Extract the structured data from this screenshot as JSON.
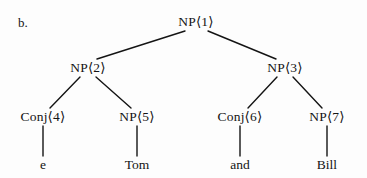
{
  "figure": {
    "label": "b.",
    "caption_present": false
  },
  "diagram": {
    "type": "syntax-tree",
    "background_color": "#fdfdfd",
    "ink_color": "#141414",
    "nodes": [
      {
        "id": "n1",
        "label": "NP⟨1⟩",
        "x": 196,
        "y": 22,
        "kind": "nonterminal"
      },
      {
        "id": "n2",
        "label": "NP⟨2⟩",
        "x": 88,
        "y": 68,
        "kind": "nonterminal"
      },
      {
        "id": "n3",
        "label": "NP⟨3⟩",
        "x": 285,
        "y": 68,
        "kind": "nonterminal"
      },
      {
        "id": "n4",
        "label": "Conj⟨4⟩",
        "x": 43,
        "y": 117,
        "kind": "nonterminal"
      },
      {
        "id": "n5",
        "label": "NP⟨5⟩",
        "x": 137,
        "y": 117,
        "kind": "nonterminal"
      },
      {
        "id": "n6",
        "label": "Conj⟨6⟩",
        "x": 240,
        "y": 117,
        "kind": "nonterminal"
      },
      {
        "id": "n7",
        "label": "NP⟨7⟩",
        "x": 327,
        "y": 117,
        "kind": "nonterminal"
      }
    ],
    "terminals": [
      {
        "id": "t1",
        "label": "e",
        "x": 43,
        "y": 165,
        "parent": "n4"
      },
      {
        "id": "t2",
        "label": "Tom",
        "x": 137,
        "y": 165,
        "parent": "n5"
      },
      {
        "id": "t3",
        "label": "and",
        "x": 240,
        "y": 165,
        "parent": "n6"
      },
      {
        "id": "t4",
        "label": "Bill",
        "x": 327,
        "y": 165,
        "parent": "n7"
      }
    ],
    "edges": [
      {
        "from": "n1",
        "to": "n2",
        "x1": 185,
        "y1": 31,
        "x2": 97,
        "y2": 59
      },
      {
        "from": "n1",
        "to": "n3",
        "x1": 208,
        "y1": 31,
        "x2": 276,
        "y2": 59
      },
      {
        "from": "n2",
        "to": "n4",
        "x1": 80,
        "y1": 77,
        "x2": 50,
        "y2": 108
      },
      {
        "from": "n2",
        "to": "n5",
        "x1": 96,
        "y1": 77,
        "x2": 131,
        "y2": 108
      },
      {
        "from": "n3",
        "to": "n6",
        "x1": 277,
        "y1": 77,
        "x2": 248,
        "y2": 108
      },
      {
        "from": "n3",
        "to": "n7",
        "x1": 293,
        "y1": 77,
        "x2": 322,
        "y2": 108
      },
      {
        "from": "n4",
        "to": "t1",
        "x1": 43,
        "y1": 126,
        "x2": 43,
        "y2": 156
      },
      {
        "from": "n5",
        "to": "t2",
        "x1": 137,
        "y1": 126,
        "x2": 137,
        "y2": 156
      },
      {
        "from": "n6",
        "to": "t3",
        "x1": 240,
        "y1": 126,
        "x2": 240,
        "y2": 156
      },
      {
        "from": "n7",
        "to": "t4",
        "x1": 327,
        "y1": 126,
        "x2": 327,
        "y2": 156
      }
    ]
  }
}
